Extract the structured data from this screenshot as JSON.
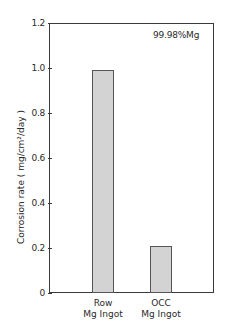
{
  "chart_data": {
    "type": "bar",
    "title": "",
    "annotation": "99.98%Mg",
    "categories": [
      "Row\nMg Ingot",
      "OCC\nMg Ingot"
    ],
    "category_lines": [
      [
        "Row",
        "Mg Ingot"
      ],
      [
        "OCC",
        "Mg Ingot"
      ]
    ],
    "values": [
      0.99,
      0.21
    ],
    "xlabel": "",
    "ylabel": "Corrosion rate ( mg/cm²/day )",
    "ylim": [
      0,
      1.2
    ],
    "yticks": [
      "0",
      "0.2",
      "0.4",
      "0.6",
      "0.8",
      "1.0",
      "1.2"
    ],
    "grid": false,
    "bar_fill": "dotted-gray"
  }
}
